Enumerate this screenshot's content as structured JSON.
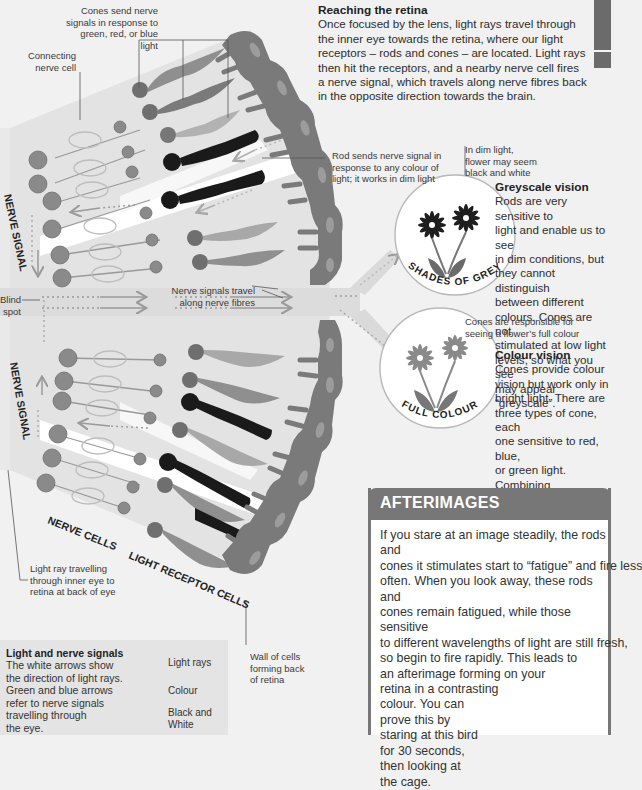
{
  "sections": {
    "reaching_retina": {
      "title": "Reaching the retina",
      "lines": [
        "Once focused by the lens, light rays travel through",
        "the inner eye towards the retina, where our light",
        "receptors – rods and cones – are located. Light rays",
        "then hit the receptors, and a nearby nerve cell fires",
        "a nerve signal, which travels along nerve fibres back",
        "in the opposite direction towards the brain."
      ]
    },
    "greyscale_vision": {
      "title": "Greyscale vision",
      "lines": [
        "Rods are very sensitive to",
        "light and enable us to see",
        "in dim conditions, but",
        "they cannot distinguish",
        "between different",
        "colours. Cones are not",
        "stimulated at low light",
        "levels, so what you see",
        "may appear “greyscale”."
      ]
    },
    "colour_vision": {
      "title": "Colour vision",
      "lines": [
        "Cones provide colour",
        "vision but work only in",
        "bright light. There are",
        "three types of cone, each",
        "one sensitive to red, blue,",
        "or green light. Combining",
        "these three colours",
        "allows us to see millions",
        "of different colours."
      ]
    },
    "afterimages": {
      "title": "AFTERIMAGES",
      "lines": [
        "If you stare at an image steadily, the rods and",
        "cones it stimulates start to “fatigue” and fire less",
        "often. When you look away, these rods and",
        "cones remain fatigued, while those sensitive",
        "to different wavelengths of light are still fresh,",
        "so begin to fire rapidly. This leads to",
        "an afterimage forming on your",
        "retina in a contrasting",
        "colour. You can",
        "prove this by",
        "staring at this bird",
        "for 30 seconds,",
        "then looking at",
        "the cage."
      ]
    }
  },
  "labels": {
    "cones": [
      "Cones send nerve",
      "signals in response to",
      "green, red, or blue light"
    ],
    "connecting_nerve_cell": [
      "Connecting",
      "nerve cell"
    ],
    "rod": [
      "Rod sends nerve signal in",
      "response to any colour of",
      "light; it works in dim light"
    ],
    "dim_light": [
      "In dim light,",
      "flower may seem",
      "black and white"
    ],
    "cones_full_colour": [
      "Cones are responsible for",
      "seeing a flower’s full colour"
    ],
    "nerve_signals_travel": [
      "Nerve signals travel",
      "along nerve fibres"
    ],
    "blind_spot": [
      "Blind",
      "spot"
    ],
    "nerve_signal_top": "NERVE SIGNAL",
    "nerve_signal_bottom": "NERVE SIGNAL",
    "nerve_cells": "NERVE CELLS",
    "light_receptor_cells": "LIGHT RECEPTOR CELLS",
    "light_ray": [
      "Light ray travelling",
      "through inner eye to",
      "retina at back of eye"
    ],
    "wall_of_cells": [
      "Wall of cells",
      "forming back",
      "of retina"
    ],
    "shades_of_grey": "SHADES OF GREY",
    "full_colour": "FULL COLOUR"
  },
  "legend": {
    "title": "Light and nerve signals",
    "lines": [
      "The white arrows show",
      "the direction of light rays.",
      "Green and blue arrows",
      "refer to nerve signals",
      "travelling through",
      "the eye."
    ],
    "items": [
      {
        "label": "Light rays",
        "arrow_color": "#ffffff"
      },
      {
        "label": "Colour",
        "arrow_color": "#8a8a8a"
      },
      {
        "label_lines": [
          "Black and",
          "White"
        ],
        "arrow_color": "#555555"
      }
    ]
  },
  "colors": {
    "background": "#f1f1f1",
    "retina_band": "#e2e2e2",
    "wall_cells": "#7a7a7a",
    "cone": "#8c8c8c",
    "rod": "#1a1a1a",
    "nerve_cell": "#8a8a8a",
    "afterimages_header": "#777777"
  }
}
